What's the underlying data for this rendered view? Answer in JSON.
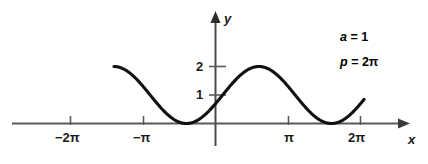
{
  "figure": {
    "title": "",
    "background_color": "#ffffff",
    "curve_color": "#111111",
    "axis_color": "#555555"
  },
  "annotations": {
    "amplitude": {
      "var": "a",
      "eq": "= 1"
    },
    "period": {
      "var": "p",
      "eq": "= 2π"
    }
  },
  "axes": {
    "x_name": "x",
    "y_name": "y",
    "x_ticks": [
      {
        "label": "−2π",
        "value": -6.2832
      },
      {
        "label": "−π",
        "value": -3.1416
      },
      {
        "label": "π",
        "value": 3.1416
      },
      {
        "label": "2π",
        "value": 6.2832
      }
    ],
    "y_ticks": [
      {
        "label": "1",
        "value": 1
      },
      {
        "label": "2",
        "value": 2
      }
    ]
  },
  "chart_data": {
    "type": "line",
    "title": "",
    "xlabel": "x",
    "ylabel": "y",
    "xlim": [
      -7.6,
      7.4
    ],
    "ylim": [
      -0.35,
      2.6
    ],
    "grid": false,
    "legend": null,
    "annotations": [
      "a = 1",
      "p = 2π"
    ],
    "series": [
      {
        "name": "y = 1 + sin(x − 0.31)",
        "amplitude": 1,
        "period": 6.2832,
        "vertical_shift": 1,
        "phase": -0.31,
        "x_start": -4.4,
        "x_end": 6.45,
        "x": [
          -4.4,
          -4.0,
          -3.6,
          -3.2,
          -2.8,
          -2.4,
          -2.0,
          -1.6,
          -1.2,
          -0.8,
          -0.4,
          0.0,
          0.4,
          0.8,
          1.2,
          1.6,
          2.0,
          2.4,
          2.8,
          3.2,
          3.6,
          4.0,
          4.4,
          4.8,
          5.2,
          5.6,
          6.0,
          6.45
        ],
        "y": [
          0.79,
          0.97,
          1.33,
          1.68,
          1.92,
          2.0,
          1.9,
          1.64,
          1.27,
          0.87,
          0.5,
          0.21,
          0.04,
          0.0,
          0.09,
          0.31,
          0.62,
          0.98,
          1.36,
          1.7,
          1.93,
          2.0,
          1.89,
          1.62,
          1.24,
          0.84,
          0.47,
          0.17
        ]
      }
    ]
  }
}
